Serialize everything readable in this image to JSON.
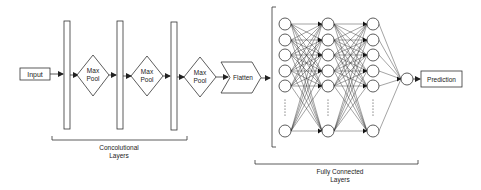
{
  "diagram": {
    "nodes": {
      "input": "Input",
      "maxpool_line1": "Max",
      "maxpool_line2": "Pool",
      "flatten": "Flatten",
      "prediction": "Prediction"
    },
    "conv_layers_count": 3,
    "maxpool_count": 3,
    "groups": {
      "conv_line1": "Concolutional",
      "conv_line2": "Layers",
      "fc_line1": "Fully Connected",
      "fc_line2": "Layers"
    },
    "fc_network": {
      "hidden_columns": 3,
      "visible_nodes_per_column": 6,
      "output_nodes": 1
    },
    "colors": {
      "stroke": "#333333",
      "background": "#ffffff"
    }
  }
}
